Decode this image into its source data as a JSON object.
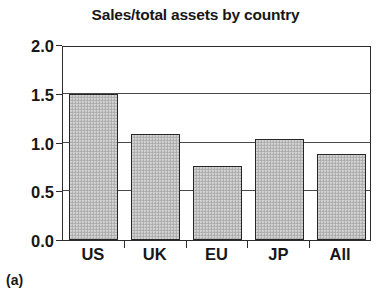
{
  "panel": {
    "label": "(a)"
  },
  "chart_data": {
    "type": "bar",
    "title": "Sales/total assets by country",
    "xlabel": "",
    "ylabel": "",
    "categories": [
      "US",
      "UK",
      "EU",
      "JP",
      "All"
    ],
    "values": [
      1.5,
      1.09,
      0.76,
      1.04,
      0.88
    ],
    "ylim": [
      0.0,
      2.0
    ],
    "yticks": [
      "0.0",
      "0.5",
      "1.0",
      "1.5",
      "2.0"
    ],
    "ytick_values": [
      0.0,
      0.5,
      1.0,
      1.5,
      2.0
    ],
    "grid": true,
    "legend": "none",
    "bar_fill_color": "#b9b9b9",
    "bar_edge_color": "#262626",
    "axis_color": "#2b2b2b",
    "background_color": "#ffffff"
  }
}
